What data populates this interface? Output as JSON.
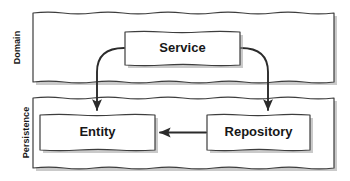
{
  "diagram": {
    "type": "layered-architecture",
    "background_color": "#ffffff",
    "stroke_color": "#3a3a3a",
    "shadow_color": "#9a9a9a",
    "text_color": "#171717",
    "fill_color": "#ffffff",
    "layers": [
      {
        "id": "domain",
        "label": "Domain",
        "label_orientation": "vertical",
        "nodes": [
          "service"
        ]
      },
      {
        "id": "persistence",
        "label": "Persistence",
        "label_orientation": "vertical",
        "nodes": [
          "entity",
          "repository"
        ]
      }
    ],
    "nodes": [
      {
        "id": "service",
        "label": "Service",
        "layer": "domain"
      },
      {
        "id": "entity",
        "label": "Entity",
        "layer": "persistence"
      },
      {
        "id": "repository",
        "label": "Repository",
        "layer": "persistence"
      }
    ],
    "edges": [
      {
        "id": "service-to-entity",
        "from": "Service",
        "to": "Entity",
        "style": "curved",
        "arrowhead": "end"
      },
      {
        "id": "service-to-repository",
        "from": "Service",
        "to": "Repository",
        "style": "curved",
        "arrowhead": "end"
      },
      {
        "id": "repository-to-entity",
        "from": "Repository",
        "to": "Entity",
        "style": "straight",
        "arrowhead": "end"
      }
    ]
  }
}
